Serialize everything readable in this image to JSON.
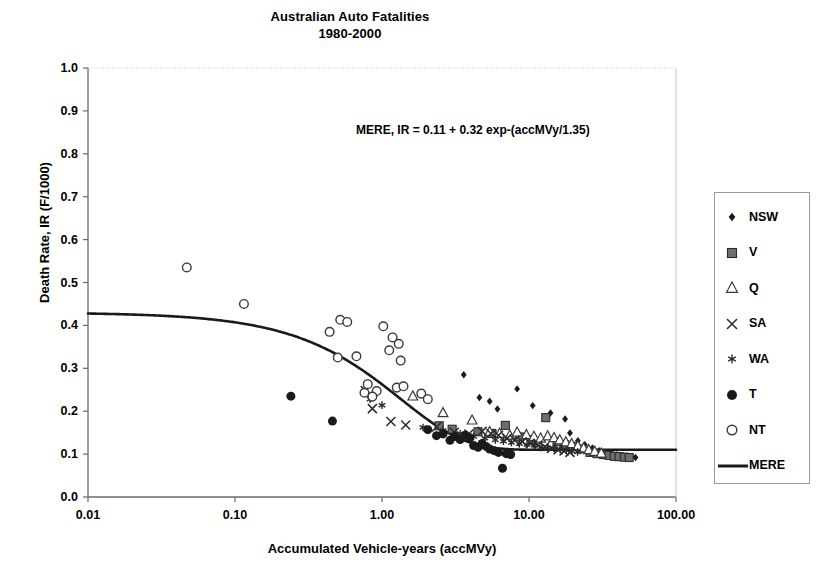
{
  "chart_data": {
    "type": "scatter",
    "title": "Australian Auto Fatalities",
    "subtitle": "1980-2000",
    "xlabel": "Accumulated Vehicle-years (accMVy)",
    "ylabel": "Death Rate, IR (F/1000)",
    "xscale": "log",
    "xlim": [
      0.01,
      100.0
    ],
    "ylim": [
      0.0,
      1.0
    ],
    "grid": false,
    "legend_position": "right",
    "annotation": "MERE, IR = 0.11 + 0.32 exp-(accMVy/1.35)",
    "xticks": [
      "0.01",
      "0.10",
      "1.00",
      "10.00",
      "100.00"
    ],
    "xtick_values": [
      0.01,
      0.1,
      1.0,
      10.0,
      100.0
    ],
    "yticks": [
      "0.0",
      "0.1",
      "0.2",
      "0.3",
      "0.4",
      "0.5",
      "0.6",
      "0.7",
      "0.8",
      "0.9",
      "1.0"
    ],
    "ytick_values": [
      0.0,
      0.1,
      0.2,
      0.3,
      0.4,
      0.5,
      0.6,
      0.7,
      0.8,
      0.9,
      1.0
    ],
    "model": {
      "name": "MERE",
      "formula": "IR = 0.11 + 0.32 exp-(accMVy/1.35)",
      "asymptote": 0.11,
      "amplitude": 0.32,
      "decay_constant": 1.35,
      "color": "#1a1a1a",
      "line_width": 2.6
    },
    "series": [
      {
        "name": "NSW",
        "marker": "filled-diamond",
        "color": "#1a1a1a",
        "size": 6,
        "points": [
          [
            3.6,
            0.285
          ],
          [
            4.6,
            0.232
          ],
          [
            5.4,
            0.223
          ],
          [
            6.1,
            0.205
          ],
          [
            8.3,
            0.252
          ],
          [
            10.6,
            0.213
          ],
          [
            14.0,
            0.196
          ],
          [
            17.6,
            0.182
          ],
          [
            19.0,
            0.149
          ],
          [
            21.5,
            0.131
          ],
          [
            24.0,
            0.122
          ],
          [
            27.0,
            0.114
          ],
          [
            30.0,
            0.108
          ],
          [
            33.0,
            0.104
          ],
          [
            36.0,
            0.101
          ],
          [
            39.5,
            0.098
          ],
          [
            43.0,
            0.096
          ],
          [
            46.5,
            0.094
          ],
          [
            50.0,
            0.093
          ],
          [
            53.0,
            0.092
          ]
        ]
      },
      {
        "name": "V",
        "marker": "filled-square",
        "color": "#6e6e6e",
        "size": 8,
        "points": [
          [
            2.45,
            0.166
          ],
          [
            3.0,
            0.158
          ],
          [
            4.5,
            0.152
          ],
          [
            5.6,
            0.148
          ],
          [
            6.9,
            0.167
          ],
          [
            8.6,
            0.14
          ],
          [
            10.5,
            0.134
          ],
          [
            13.0,
            0.185
          ],
          [
            15.5,
            0.129
          ],
          [
            17.5,
            0.122
          ],
          [
            20.0,
            0.118
          ],
          [
            23.0,
            0.112
          ],
          [
            26.0,
            0.104
          ],
          [
            29.0,
            0.101
          ],
          [
            32.0,
            0.099
          ],
          [
            35.0,
            0.097
          ],
          [
            38.0,
            0.095
          ],
          [
            41.0,
            0.094
          ],
          [
            44.5,
            0.093
          ],
          [
            48.0,
            0.092
          ]
        ]
      },
      {
        "name": "Q",
        "marker": "open-triangle",
        "color": "#3a3a3a",
        "size": 8,
        "points": [
          [
            1.62,
            0.235
          ],
          [
            2.6,
            0.196
          ],
          [
            4.1,
            0.179
          ],
          [
            5.4,
            0.152
          ],
          [
            6.3,
            0.148
          ],
          [
            7.4,
            0.144
          ],
          [
            8.3,
            0.151
          ],
          [
            9.6,
            0.145
          ],
          [
            10.8,
            0.141
          ],
          [
            12.0,
            0.137
          ],
          [
            13.4,
            0.142
          ],
          [
            14.8,
            0.138
          ],
          [
            16.2,
            0.133
          ],
          [
            17.8,
            0.128
          ],
          [
            19.5,
            0.124
          ],
          [
            21.5,
            0.119
          ],
          [
            23.5,
            0.114
          ],
          [
            25.5,
            0.11
          ],
          [
            28.0,
            0.106
          ],
          [
            31.0,
            0.102
          ]
        ]
      },
      {
        "name": "SA",
        "marker": "cross-x",
        "color": "#2a2a2a",
        "size": 8,
        "points": [
          [
            0.77,
            0.248
          ],
          [
            0.86,
            0.206
          ],
          [
            1.15,
            0.176
          ],
          [
            1.45,
            0.168
          ],
          [
            2.35,
            0.163
          ],
          [
            3.1,
            0.151
          ],
          [
            3.9,
            0.147
          ],
          [
            4.8,
            0.153
          ],
          [
            5.5,
            0.148
          ],
          [
            6.2,
            0.144
          ],
          [
            7.1,
            0.137
          ],
          [
            8.0,
            0.133
          ],
          [
            9.0,
            0.129
          ],
          [
            10.2,
            0.125
          ],
          [
            11.5,
            0.121
          ],
          [
            12.8,
            0.117
          ],
          [
            14.2,
            0.113
          ],
          [
            15.8,
            0.11
          ],
          [
            17.3,
            0.107
          ],
          [
            19.0,
            0.104
          ]
        ]
      },
      {
        "name": "WA",
        "marker": "star",
        "color": "#2a2a2a",
        "size": 7,
        "points": [
          [
            0.83,
            0.228
          ],
          [
            1.0,
            0.214
          ],
          [
            1.9,
            0.162
          ],
          [
            2.6,
            0.155
          ],
          [
            3.4,
            0.148
          ],
          [
            4.2,
            0.141
          ],
          [
            5.0,
            0.137
          ],
          [
            5.9,
            0.133
          ],
          [
            6.7,
            0.13
          ],
          [
            7.6,
            0.127
          ],
          [
            8.6,
            0.124
          ],
          [
            9.7,
            0.122
          ],
          [
            10.9,
            0.12
          ],
          [
            12.1,
            0.117
          ],
          [
            13.4,
            0.115
          ],
          [
            14.8,
            0.113
          ],
          [
            16.3,
            0.111
          ],
          [
            17.9,
            0.109
          ],
          [
            19.6,
            0.107
          ],
          [
            21.4,
            0.105
          ]
        ]
      },
      {
        "name": "T",
        "marker": "filled-circle",
        "color": "#1a1a1a",
        "size": 9,
        "points": [
          [
            0.24,
            0.235
          ],
          [
            0.46,
            0.177
          ],
          [
            2.05,
            0.157
          ],
          [
            2.35,
            0.143
          ],
          [
            2.6,
            0.147
          ],
          [
            2.9,
            0.132
          ],
          [
            3.15,
            0.141
          ],
          [
            3.4,
            0.134
          ],
          [
            3.7,
            0.144
          ],
          [
            3.95,
            0.138
          ],
          [
            4.2,
            0.12
          ],
          [
            4.5,
            0.116
          ],
          [
            4.8,
            0.125
          ],
          [
            5.1,
            0.118
          ],
          [
            5.4,
            0.112
          ],
          [
            5.8,
            0.108
          ],
          [
            6.2,
            0.104
          ],
          [
            6.6,
            0.067
          ],
          [
            7.0,
            0.101
          ],
          [
            7.5,
            0.099
          ]
        ]
      },
      {
        "name": "NT",
        "marker": "open-circle",
        "color": "#3a3a3a",
        "size": 9,
        "points": [
          [
            0.047,
            0.535
          ],
          [
            0.115,
            0.45
          ],
          [
            0.44,
            0.385
          ],
          [
            0.52,
            0.413
          ],
          [
            0.58,
            0.408
          ],
          [
            0.5,
            0.325
          ],
          [
            0.67,
            0.328
          ],
          [
            0.8,
            0.263
          ],
          [
            0.76,
            0.243
          ],
          [
            0.92,
            0.247
          ],
          [
            1.02,
            0.398
          ],
          [
            1.18,
            0.372
          ],
          [
            1.12,
            0.342
          ],
          [
            1.3,
            0.357
          ],
          [
            1.34,
            0.318
          ],
          [
            1.26,
            0.255
          ],
          [
            1.4,
            0.258
          ],
          [
            1.85,
            0.241
          ],
          [
            2.05,
            0.228
          ],
          [
            0.86,
            0.234
          ]
        ]
      }
    ]
  }
}
